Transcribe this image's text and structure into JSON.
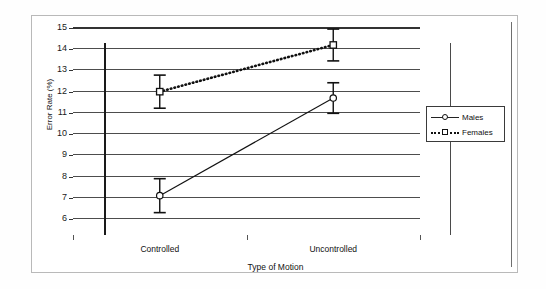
{
  "chart_data": {
    "type": "line",
    "title": "",
    "xlabel": "Type of Motion",
    "ylabel": "Error Rate (%)",
    "categories": [
      "Controlled",
      "Uncontrolled"
    ],
    "ylim": [
      6,
      15
    ],
    "yticks": [
      6,
      7,
      8,
      9,
      10,
      11,
      12,
      13,
      14,
      15
    ],
    "ytick_labels": [
      "6",
      "7",
      "8",
      "9",
      "10",
      "11",
      "12",
      "13",
      "14",
      "15"
    ],
    "grid": true,
    "legend_position": "right",
    "series": [
      {
        "name": "Males",
        "values": [
          7.1,
          11.7
        ],
        "errors": [
          0.8,
          0.72
        ],
        "marker": "circle",
        "line_style": "solid",
        "color": "#111111"
      },
      {
        "name": "Females",
        "values": [
          12.0,
          14.2
        ],
        "errors": [
          0.78,
          0.75
        ],
        "marker": "square",
        "line_style": "dotted",
        "color": "#111111"
      }
    ]
  },
  "legend": {
    "entries": [
      {
        "label": "Males",
        "marker": "circle-marker",
        "style": "solid"
      },
      {
        "label": "Females",
        "marker": "square-marker",
        "style": "dotted"
      }
    ]
  },
  "axes": {
    "y_title": "Error Rate (%)",
    "x_title": "Type of Motion",
    "x_labels": [
      "Controlled",
      "Uncontrolled"
    ],
    "y_labels": [
      "15",
      "14",
      "13",
      "12",
      "11",
      "10",
      "9",
      "8",
      "7",
      "6"
    ]
  },
  "colors": {
    "frame": "#b9b9b9",
    "grid": "#333333",
    "ink": "#111111",
    "background": "#ffffff"
  }
}
